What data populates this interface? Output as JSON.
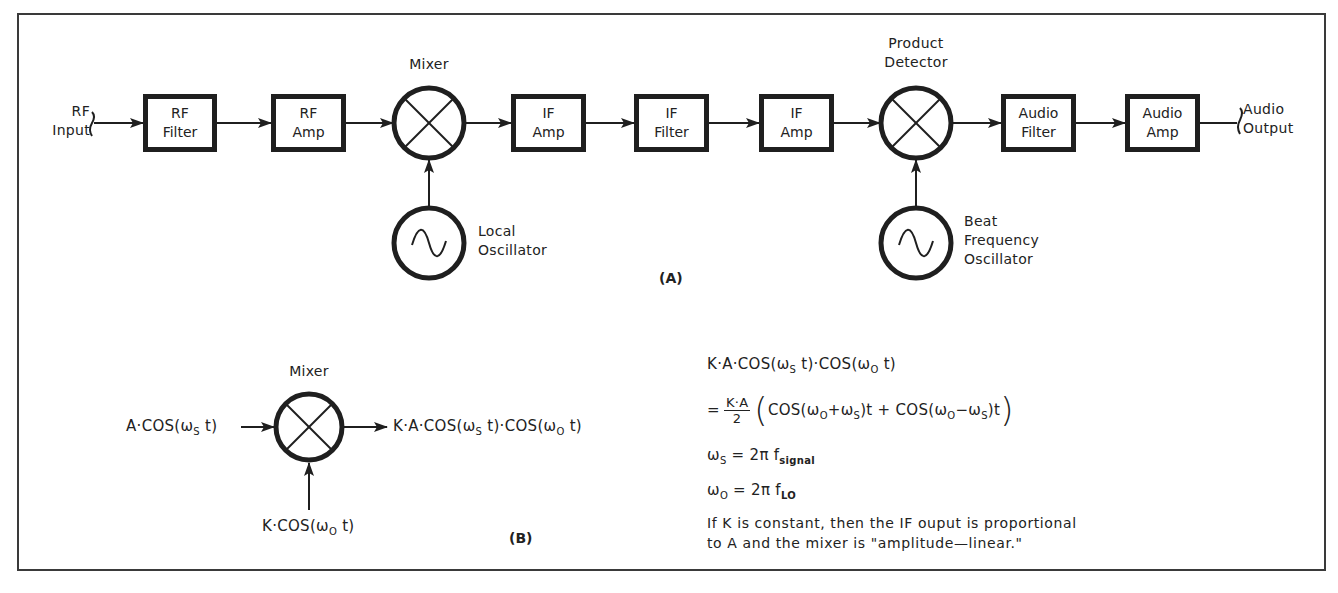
{
  "diagram": {
    "part_a": {
      "caption": "(A)",
      "input_label": [
        "RF",
        "Input"
      ],
      "output_label": [
        "Audio",
        "Output"
      ],
      "blocks": [
        {
          "id": "rf-filter",
          "lines": [
            "RF",
            "Filter"
          ]
        },
        {
          "id": "rf-amp",
          "lines": [
            "RF",
            "Amp"
          ]
        },
        {
          "id": "if-amp-1",
          "lines": [
            "IF",
            "Amp"
          ]
        },
        {
          "id": "if-filter",
          "lines": [
            "IF",
            "Filter"
          ]
        },
        {
          "id": "if-amp-2",
          "lines": [
            "IF",
            "Amp"
          ]
        },
        {
          "id": "audio-filter",
          "lines": [
            "Audio",
            "Filter"
          ]
        },
        {
          "id": "audio-amp",
          "lines": [
            "Audio",
            "Amp"
          ]
        }
      ],
      "mixer_label": "Mixer",
      "product_detector_label": [
        "Product",
        "Detector"
      ],
      "local_oscillator_label": [
        "Local",
        "Oscillator"
      ],
      "bfo_label": [
        "Beat",
        "Frequency",
        "Oscillator"
      ]
    },
    "part_b": {
      "caption": "(B)",
      "mixer_label": "Mixer",
      "input_signal": "A·COS(ωs t)",
      "lo_signal": "K·COS(ωo t)",
      "output_signal": "K·A·COS(ωs t)·COS(ωo t)"
    },
    "equations": {
      "line1": "K·A·COS(ωs t)·COS(ωo t)",
      "line2_frac_num": "K·A",
      "line2_frac_den": "2",
      "line2_body": "COS(ωo+ωs)t + COS(ωo−ωs)t",
      "line3": "ωs = 2π f signal",
      "line4": "ωo = 2π f LO",
      "note_line1": "If K is constant, then the IF ouput is proportional",
      "note_line2": "to A and the mixer is \"amplitude—linear.\""
    }
  }
}
